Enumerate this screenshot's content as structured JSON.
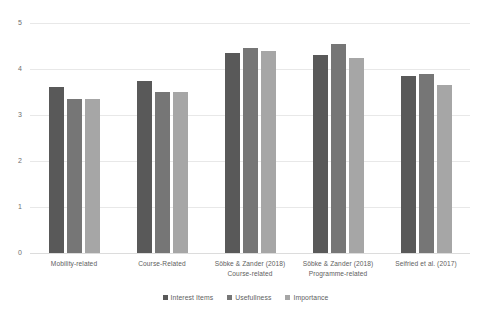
{
  "chart_data": {
    "type": "bar",
    "title": "",
    "xlabel": "",
    "ylabel": "",
    "ylim": [
      0,
      5
    ],
    "yticks": [
      "0",
      "1",
      "2",
      "3",
      "4",
      "5"
    ],
    "grid": true,
    "legend_position": "bottom",
    "categories": [
      "Mobility-related",
      "Course-Related",
      "Söbke & Zander (2018)\nCourse-related",
      "Söbke & Zander (2018)\nProgramme-related",
      "Seifried et al. (2017)"
    ],
    "category_lines": [
      {
        "line1": "Mobility-related",
        "line2": ""
      },
      {
        "line1": "Course-Related",
        "line2": ""
      },
      {
        "line1": "Söbke & Zander (2018)",
        "line2": "Course-related"
      },
      {
        "line1": "Söbke & Zander (2018)",
        "line2": "Programme-related"
      },
      {
        "line1": "Seifried et al. (2017)",
        "line2": ""
      }
    ],
    "series": [
      {
        "name": "Interest Items",
        "color": "#595959",
        "values": [
          3.6,
          3.75,
          4.35,
          4.3,
          3.85
        ]
      },
      {
        "name": "Usefullness",
        "color": "#767676",
        "values": [
          3.35,
          3.5,
          4.45,
          4.55,
          3.9
        ]
      },
      {
        "name": "Importance",
        "color": "#a6a6a6",
        "values": [
          3.35,
          3.5,
          4.4,
          4.25,
          3.65
        ]
      }
    ]
  },
  "axis": {
    "y_tick_5": "5",
    "y_tick_4": "4",
    "y_tick_3": "3",
    "y_tick_2": "2",
    "y_tick_1": "1",
    "y_tick_0": "0"
  },
  "legend": {
    "items": [
      {
        "label": "Interest Items"
      },
      {
        "label": "Usefullness"
      },
      {
        "label": "Importance"
      }
    ]
  }
}
